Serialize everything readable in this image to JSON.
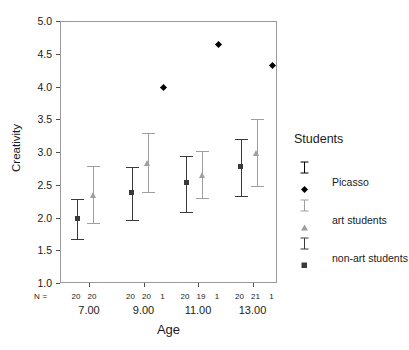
{
  "chart_data": {
    "type": "scatter",
    "title": "",
    "xlabel": "Age",
    "ylabel": "Creativity",
    "ylim": [
      1.0,
      5.0
    ],
    "yticks": [
      "1.0",
      "1.5",
      "2.0",
      "2.5",
      "3.0",
      "3.5",
      "4.0",
      "4.5",
      "5.0"
    ],
    "categories": [
      "7.00",
      "9.00",
      "11.00",
      "13.00"
    ],
    "grid": false,
    "legend_position": "right",
    "error_bar_note": "95% CI",
    "n_row_label": "N =",
    "series": [
      {
        "name": "non-art students",
        "marker": "square",
        "color": "#3a3a3a",
        "values": [
          2.0,
          2.4,
          2.55,
          2.8
        ],
        "ci_lower": [
          1.68,
          1.98,
          2.1,
          2.35
        ],
        "ci_upper": [
          2.3,
          2.78,
          2.96,
          3.22
        ],
        "n": [
          20,
          20,
          20,
          20
        ]
      },
      {
        "name": "art students",
        "marker": "triangle",
        "color": "#9e9e9e",
        "values": [
          2.36,
          2.85,
          2.66,
          3.0
        ],
        "ci_lower": [
          1.93,
          2.4,
          2.32,
          2.5
        ],
        "ci_upper": [
          2.8,
          3.3,
          3.03,
          3.52
        ],
        "n": [
          20,
          20,
          19,
          21
        ]
      },
      {
        "name": "Picasso",
        "marker": "diamond",
        "color": "#000000",
        "values": [
          null,
          4.0,
          4.65,
          4.33
        ],
        "ci_lower": [
          null,
          null,
          null,
          null
        ],
        "ci_upper": [
          null,
          null,
          null,
          null
        ],
        "n": [
          null,
          1,
          1,
          1
        ]
      }
    ],
    "n_rows": [
      {
        "age": "7.00",
        "counts": [
          "20",
          "20",
          ""
        ]
      },
      {
        "age": "9.00",
        "counts": [
          "20",
          "20",
          "1"
        ]
      },
      {
        "age": "11.00",
        "counts": [
          "20",
          "19",
          "1"
        ]
      },
      {
        "age": "13.00",
        "counts": [
          "20",
          "21",
          "1"
        ]
      }
    ]
  },
  "legend": {
    "title": "Students",
    "items": [
      {
        "label": "Picasso",
        "marker": "diamond",
        "color": "#000000"
      },
      {
        "label": "art students",
        "marker": "triangle",
        "color": "#9e9e9e"
      },
      {
        "label": "non-art students",
        "marker": "square",
        "color": "#3a3a3a"
      }
    ]
  },
  "colors": {
    "dark": "#3a3a3a",
    "grey": "#9e9e9e",
    "black": "#000000",
    "frame": "#9a9a9a"
  }
}
